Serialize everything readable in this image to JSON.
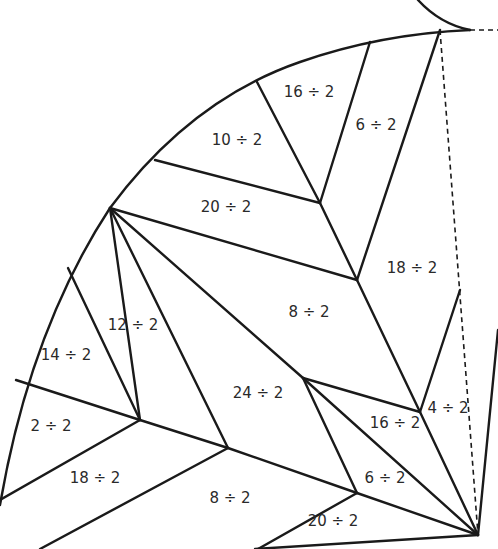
{
  "line_color": "#1a1a1a",
  "text_color": "#2a2a2a",
  "regions": [
    {
      "id": "r1",
      "label": "16 ÷ 2",
      "x": 309,
      "y": 92
    },
    {
      "id": "r2",
      "label": "6 ÷ 2",
      "x": 376,
      "y": 125
    },
    {
      "id": "r3",
      "label": "10 ÷ 2",
      "x": 237,
      "y": 140
    },
    {
      "id": "r4",
      "label": "20 ÷ 2",
      "x": 226,
      "y": 207
    },
    {
      "id": "r5",
      "label": "18 ÷ 2",
      "x": 412,
      "y": 268
    },
    {
      "id": "r6",
      "label": "8 ÷ 2",
      "x": 309,
      "y": 312
    },
    {
      "id": "r7",
      "label": "12 ÷ 2",
      "x": 133,
      "y": 325
    },
    {
      "id": "r8",
      "label": "14 ÷ 2",
      "x": 66,
      "y": 355
    },
    {
      "id": "r9",
      "label": "24 ÷ 2",
      "x": 258,
      "y": 393
    },
    {
      "id": "r10",
      "label": "4 ÷ 2",
      "x": 448,
      "y": 408
    },
    {
      "id": "r11",
      "label": "16 ÷ 2",
      "x": 395,
      "y": 423
    },
    {
      "id": "r12",
      "label": "2 ÷ 2",
      "x": 51,
      "y": 426
    },
    {
      "id": "r13",
      "label": "18 ÷ 2",
      "x": 95,
      "y": 478
    },
    {
      "id": "r14",
      "label": "6 ÷ 2",
      "x": 385,
      "y": 478
    },
    {
      "id": "r15",
      "label": "8 ÷ 2",
      "x": 230,
      "y": 498
    },
    {
      "id": "r16",
      "label": "20 ÷ 2",
      "x": 333,
      "y": 521
    }
  ]
}
